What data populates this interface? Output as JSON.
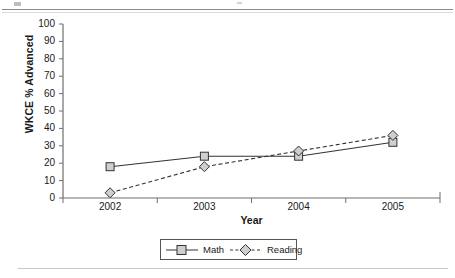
{
  "chart_data": {
    "type": "line",
    "title": "",
    "xlabel": "Year",
    "ylabel": "WKCE % Advanced",
    "categories": [
      "2002",
      "2003",
      "2004",
      "2005"
    ],
    "series": [
      {
        "name": "Math",
        "values": [
          18,
          24,
          24,
          32
        ],
        "line_style": "solid",
        "marker": "square",
        "color": "#333333"
      },
      {
        "name": "Reading",
        "values": [
          3,
          18,
          27,
          36
        ],
        "line_style": "dashed",
        "marker": "diamond",
        "color": "#333333"
      }
    ],
    "ylim": [
      0,
      100
    ],
    "ytick_step": 10,
    "yticks": [
      "100",
      "90",
      "80",
      "70",
      "60",
      "50",
      "40",
      "30",
      "20",
      "10",
      "0"
    ],
    "grid": false,
    "legend_position": "bottom"
  },
  "axes": {
    "y_title": "WKCE % Advanced",
    "x_title": "Year"
  },
  "legend": {
    "items": [
      {
        "label": "Math"
      },
      {
        "label": "Reading"
      }
    ]
  }
}
